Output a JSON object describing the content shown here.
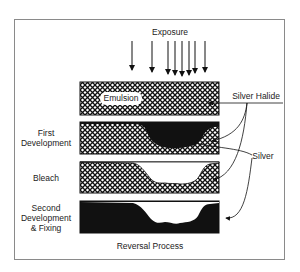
{
  "title": "Reversal Process",
  "top_label": "Exposure",
  "emulsion_label": "Emulsion",
  "callouts": {
    "silver_halide": "Silver Halide",
    "silver": "Silver"
  },
  "stages": [
    {
      "label": "First\nDevelopment",
      "lines": [
        "First",
        "Development"
      ]
    },
    {
      "label": "Bleach",
      "lines": [
        "Bleach"
      ]
    },
    {
      "label": "Second\nDevelopment\n& Fixing",
      "lines": [
        "Second",
        "Development",
        "& Fixing"
      ]
    }
  ],
  "colors": {
    "ink": "#111111",
    "frame": "#8a8a8a",
    "background": "#ffffff"
  },
  "exposure_arrows": 8
}
